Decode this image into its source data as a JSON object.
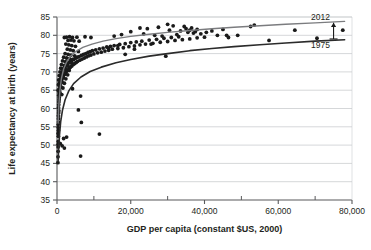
{
  "chart_data": {
    "type": "scatter",
    "title": "",
    "subtitle": "",
    "xlabel": "GDP per capita (constant $US, 2000)",
    "ylabel": "Life expectancy at birth (years)",
    "xlim": [
      0,
      80000
    ],
    "ylim": [
      35,
      85
    ],
    "xticks": [
      0,
      20000,
      40000,
      60000,
      80000
    ],
    "xtick_labels": [
      "0",
      "20,000",
      "40,000",
      "60,000",
      "80,000"
    ],
    "xminor_ticks": [
      10000,
      30000,
      50000,
      70000
    ],
    "yticks": [
      35,
      40,
      45,
      50,
      55,
      60,
      65,
      70,
      75,
      80,
      85
    ],
    "ytick_labels": [
      "35",
      "40",
      "45",
      "50",
      "55",
      "60",
      "65",
      "70",
      "75",
      "80",
      "85"
    ],
    "grid": "horizontal",
    "grid_color": "#b9bcc0",
    "frame_color": "#58595b",
    "point_color": "#1a1a1a",
    "point_radius": 1.9,
    "annotations": [
      {
        "name": "curve-label-2012",
        "text": "2012",
        "x": 74000,
        "y": 85.0,
        "anchor": "end"
      },
      {
        "name": "curve-label-1975",
        "text": "1975",
        "x": 74000,
        "y": 77.3,
        "anchor": "end"
      },
      {
        "name": "gap-arrow",
        "text": "",
        "x": 75000,
        "y_from": 79.0,
        "y_to": 83.4
      }
    ],
    "series": [
      {
        "name": "2012",
        "label": "2012",
        "type": "line",
        "color": "#7b7c7f",
        "width": 1.4,
        "fit": "logarithmic",
        "points": [
          [
            300,
            56.0
          ],
          [
            500,
            61.0
          ],
          [
            800,
            65.0
          ],
          [
            1200,
            68.2
          ],
          [
            1800,
            70.8
          ],
          [
            2600,
            72.7
          ],
          [
            3600,
            74.2
          ],
          [
            5000,
            75.5
          ],
          [
            7000,
            76.7
          ],
          [
            9500,
            77.6
          ],
          [
            12500,
            78.4
          ],
          [
            16000,
            79.1
          ],
          [
            20000,
            79.7
          ],
          [
            25000,
            80.3
          ],
          [
            30000,
            80.8
          ],
          [
            36000,
            81.3
          ],
          [
            42000,
            81.8
          ],
          [
            48000,
            82.2
          ],
          [
            55000,
            82.6
          ],
          [
            62000,
            83.0
          ],
          [
            70000,
            83.4
          ],
          [
            78000,
            83.8
          ]
        ]
      },
      {
        "name": "1975",
        "label": "1975",
        "type": "line",
        "color": "#2b2b2b",
        "width": 1.6,
        "fit": "logarithmic",
        "points": [
          [
            300,
            45.5
          ],
          [
            450,
            49.0
          ],
          [
            700,
            53.0
          ],
          [
            1000,
            56.4
          ],
          [
            1500,
            59.6
          ],
          [
            2200,
            62.4
          ],
          [
            3200,
            64.8
          ],
          [
            4500,
            66.8
          ],
          [
            6500,
            68.6
          ],
          [
            9000,
            70.1
          ],
          [
            12000,
            71.3
          ],
          [
            16000,
            72.5
          ],
          [
            20000,
            73.4
          ],
          [
            25000,
            74.3
          ],
          [
            30000,
            75.0
          ],
          [
            36000,
            75.8
          ],
          [
            42000,
            76.4
          ],
          [
            48000,
            76.9
          ],
          [
            55000,
            77.4
          ],
          [
            62000,
            77.9
          ],
          [
            70000,
            78.4
          ],
          [
            78000,
            78.8
          ]
        ]
      },
      {
        "name": "countries-2012",
        "label": "Countries",
        "type": "scatter",
        "color": "#1a1a1a",
        "points": [
          [
            250,
            45.2
          ],
          [
            280,
            46.8
          ],
          [
            300,
            48.3
          ],
          [
            320,
            49.5
          ],
          [
            300,
            50.2
          ],
          [
            340,
            51.0
          ],
          [
            360,
            52.4
          ],
          [
            300,
            53.2
          ],
          [
            380,
            54.0
          ],
          [
            350,
            54.8
          ],
          [
            330,
            55.6
          ],
          [
            420,
            56.3
          ],
          [
            400,
            57.2
          ],
          [
            380,
            58.0
          ],
          [
            450,
            58.8
          ],
          [
            500,
            59.4
          ],
          [
            420,
            60.2
          ],
          [
            480,
            61.0
          ],
          [
            520,
            61.8
          ],
          [
            560,
            62.4
          ],
          [
            600,
            63.0
          ],
          [
            500,
            63.6
          ],
          [
            650,
            64.2
          ],
          [
            700,
            64.8
          ],
          [
            560,
            65.2
          ],
          [
            800,
            65.6
          ],
          [
            900,
            66.0
          ],
          [
            750,
            66.4
          ],
          [
            1000,
            66.8
          ],
          [
            650,
            67.0
          ],
          [
            1100,
            67.4
          ],
          [
            1250,
            67.8
          ],
          [
            900,
            68.0
          ],
          [
            1400,
            68.3
          ],
          [
            1600,
            68.6
          ],
          [
            1000,
            68.9
          ],
          [
            1800,
            69.1
          ],
          [
            2100,
            69.4
          ],
          [
            1300,
            69.6
          ],
          [
            2400,
            69.9
          ],
          [
            1500,
            70.1
          ],
          [
            2700,
            70.3
          ],
          [
            3000,
            70.5
          ],
          [
            1700,
            70.7
          ],
          [
            3300,
            70.9
          ],
          [
            1900,
            71.1
          ],
          [
            3600,
            71.3
          ],
          [
            2200,
            71.5
          ],
          [
            4000,
            71.6
          ],
          [
            2500,
            71.8
          ],
          [
            4400,
            72.0
          ],
          [
            2800,
            72.1
          ],
          [
            4800,
            72.3
          ],
          [
            3200,
            72.5
          ],
          [
            5200,
            72.6
          ],
          [
            3600,
            72.8
          ],
          [
            5600,
            72.9
          ],
          [
            4000,
            73.1
          ],
          [
            6200,
            73.2
          ],
          [
            4500,
            73.4
          ],
          [
            6800,
            73.5
          ],
          [
            5000,
            73.7
          ],
          [
            7400,
            73.8
          ],
          [
            5500,
            74.0
          ],
          [
            8000,
            74.1
          ],
          [
            6000,
            74.2
          ],
          [
            8600,
            74.4
          ],
          [
            6600,
            74.5
          ],
          [
            9200,
            74.6
          ],
          [
            7200,
            74.8
          ],
          [
            10000,
            74.9
          ],
          [
            7800,
            75.0
          ],
          [
            11000,
            75.2
          ],
          [
            8400,
            75.3
          ],
          [
            12000,
            75.4
          ],
          [
            9000,
            75.5
          ],
          [
            13000,
            75.7
          ],
          [
            9600,
            75.8
          ],
          [
            14000,
            75.9
          ],
          [
            10500,
            76.0
          ],
          [
            15000,
            76.2
          ],
          [
            11500,
            76.3
          ],
          [
            16500,
            76.4
          ],
          [
            12500,
            76.5
          ],
          [
            18000,
            76.6
          ],
          [
            13500,
            76.8
          ],
          [
            19500,
            76.9
          ],
          [
            14500,
            77.0
          ],
          [
            21000,
            77.1
          ],
          [
            15500,
            77.2
          ],
          [
            22500,
            77.4
          ],
          [
            17000,
            77.5
          ],
          [
            24000,
            77.6
          ],
          [
            18500,
            77.7
          ],
          [
            26000,
            77.8
          ],
          [
            20000,
            78.0
          ],
          [
            28000,
            78.1
          ],
          [
            21500,
            78.2
          ],
          [
            30000,
            78.3
          ],
          [
            23000,
            78.4
          ],
          [
            32000,
            78.6
          ],
          [
            25000,
            78.7
          ],
          [
            34000,
            78.8
          ],
          [
            27000,
            78.9
          ],
          [
            36000,
            79.0
          ],
          [
            29000,
            79.2
          ],
          [
            38000,
            79.3
          ],
          [
            31000,
            79.4
          ],
          [
            40000,
            79.5
          ],
          [
            33000,
            79.6
          ],
          [
            2000,
            79.4
          ],
          [
            2600,
            79.5
          ],
          [
            3400,
            79.6
          ],
          [
            4200,
            79.4
          ],
          [
            5400,
            79.5
          ],
          [
            7600,
            79.6
          ],
          [
            9200,
            79.4
          ],
          [
            3000,
            78.6
          ],
          [
            3800,
            78.7
          ],
          [
            4600,
            78.5
          ],
          [
            6000,
            78.4
          ],
          [
            2400,
            77.6
          ],
          [
            3200,
            77.4
          ],
          [
            4000,
            77.2
          ],
          [
            5000,
            77.0
          ],
          [
            2800,
            76.2
          ],
          [
            3600,
            76.0
          ],
          [
            4400,
            75.8
          ],
          [
            5800,
            75.6
          ],
          [
            2200,
            75.0
          ],
          [
            3000,
            74.8
          ],
          [
            3800,
            74.6
          ],
          [
            4800,
            74.4
          ],
          [
            1800,
            74.0
          ],
          [
            2600,
            73.8
          ],
          [
            3400,
            73.6
          ],
          [
            4200,
            73.4
          ],
          [
            1500,
            73.0
          ],
          [
            2300,
            72.8
          ],
          [
            3100,
            72.6
          ],
          [
            3900,
            72.4
          ],
          [
            1200,
            72.0
          ],
          [
            2000,
            71.8
          ],
          [
            2800,
            71.6
          ],
          [
            3600,
            71.4
          ],
          [
            1000,
            71.0
          ],
          [
            1700,
            70.8
          ],
          [
            2500,
            70.6
          ],
          [
            3300,
            70.4
          ],
          [
            800,
            70.0
          ],
          [
            1400,
            69.8
          ],
          [
            2100,
            69.5
          ],
          [
            2900,
            69.2
          ],
          [
            600,
            69.0
          ],
          [
            1100,
            68.7
          ],
          [
            1700,
            68.4
          ],
          [
            2400,
            68.1
          ],
          [
            450,
            67.8
          ],
          [
            900,
            67.5
          ],
          [
            1400,
            67.2
          ],
          [
            2000,
            66.9
          ],
          [
            380,
            66.5
          ],
          [
            700,
            66.2
          ],
          [
            1100,
            65.9
          ],
          [
            1600,
            65.6
          ],
          [
            320,
            65.0
          ],
          [
            550,
            64.6
          ],
          [
            850,
            64.2
          ],
          [
            1300,
            63.8
          ],
          [
            4200,
            65.4
          ],
          [
            6400,
            63.4
          ],
          [
            6600,
            56.2
          ],
          [
            5800,
            59.6
          ],
          [
            11500,
            53.0
          ],
          [
            6400,
            47.0
          ],
          [
            2600,
            52.2
          ],
          [
            1800,
            51.8
          ],
          [
            2000,
            49.2
          ],
          [
            1400,
            49.8
          ],
          [
            900,
            50.4
          ],
          [
            14000,
            76.5
          ],
          [
            15500,
            79.8
          ],
          [
            16500,
            77.2
          ],
          [
            17500,
            80.2
          ],
          [
            18500,
            74.8
          ],
          [
            20000,
            81.0
          ],
          [
            21000,
            76.2
          ],
          [
            22500,
            82.0
          ],
          [
            23500,
            80.4
          ],
          [
            24500,
            81.8
          ],
          [
            25500,
            77.6
          ],
          [
            26500,
            80.0
          ],
          [
            27500,
            82.2
          ],
          [
            28500,
            79.8
          ],
          [
            29500,
            74.3
          ],
          [
            30000,
            83.0
          ],
          [
            30500,
            81.4
          ],
          [
            31500,
            82.6
          ],
          [
            32500,
            80.2
          ],
          [
            33500,
            81.2
          ],
          [
            34500,
            82.4
          ],
          [
            35000,
            81.8
          ],
          [
            35500,
            80.8
          ],
          [
            36000,
            81.4
          ],
          [
            36500,
            82.0
          ],
          [
            37000,
            80.6
          ],
          [
            37500,
            81.0
          ],
          [
            38000,
            81.6
          ],
          [
            39000,
            80.4
          ],
          [
            40500,
            80.8
          ],
          [
            42000,
            81.2
          ],
          [
            43500,
            80.0
          ],
          [
            45000,
            81.6
          ],
          [
            46000,
            80.0
          ],
          [
            46500,
            79.4
          ],
          [
            49000,
            80.0
          ],
          [
            52500,
            82.4
          ],
          [
            53500,
            82.8
          ],
          [
            57500,
            78.6
          ],
          [
            64500,
            81.4
          ],
          [
            70500,
            79.2
          ],
          [
            77500,
            81.4
          ]
        ]
      }
    ]
  }
}
